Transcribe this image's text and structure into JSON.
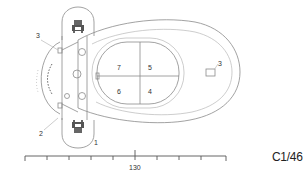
{
  "diagram": {
    "type": "technical plan drawing",
    "compartment_labels": {
      "top_left": "7",
      "top_right": "5",
      "bottom_left": "6",
      "bottom_right": "4"
    },
    "callouts": {
      "left_top": "3",
      "left_bottom": "2",
      "bottom_cap": "1",
      "right_outlet": "3"
    },
    "scale_bar": {
      "label": "130",
      "ticks": 11
    },
    "reference_code": "C1/46",
    "colors": {
      "line": "#8a8a8a",
      "text": "#333333",
      "background": "#ffffff"
    }
  }
}
